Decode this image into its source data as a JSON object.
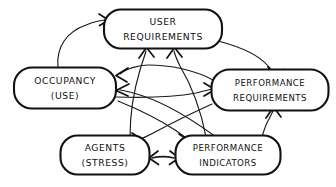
{
  "diagram": {
    "style": "hand-drawn sketch",
    "background_color": "#ffffff",
    "ink_color": "#111111",
    "nodes": [
      {
        "id": "user-requirements",
        "line1": "USER",
        "line2": "REQUIREMENTS",
        "x": 163,
        "y": 29,
        "width": 118,
        "height": 39
      },
      {
        "id": "occupancy-use",
        "line1": "OCCUPANCY",
        "line2": "(USE)",
        "x": 65,
        "y": 88,
        "width": 102,
        "height": 41
      },
      {
        "id": "performance-requirements",
        "line1": "PERFORMANCE",
        "line2": "REQUIREMENTS",
        "x": 270,
        "y": 90,
        "width": 117,
        "height": 41
      },
      {
        "id": "agents-stress",
        "line1": "AGENTS",
        "line2": "(STRESS)",
        "x": 105,
        "y": 155,
        "width": 89,
        "height": 39
      },
      {
        "id": "performance-indicators",
        "line1": "PERFORMANCE",
        "line2": "INDICATORS",
        "x": 228,
        "y": 155,
        "width": 105,
        "height": 39
      }
    ],
    "edges": [
      {
        "id": "occupancy-to-user-requirements",
        "from": "occupancy-use",
        "to": "user-requirements",
        "arrows": "single"
      },
      {
        "id": "user-requirements-to-performance-requirements",
        "from": "user-requirements",
        "to": "performance-requirements",
        "arrows": "single"
      },
      {
        "id": "performance-indicators-to-user-requirements",
        "from": "performance-indicators",
        "to": "user-requirements",
        "arrows": "single"
      },
      {
        "id": "agents-to-user-requirements",
        "from": "agents-stress",
        "to": "user-requirements",
        "arrows": "single"
      },
      {
        "id": "performance-requirements-to-occupancy",
        "from": "performance-requirements",
        "to": "occupancy-use",
        "arrows": "single"
      },
      {
        "id": "performance-indicators-to-occupancy",
        "from": "performance-indicators",
        "to": "occupancy-use",
        "arrows": "single"
      },
      {
        "id": "occupancy-to-performance-requirements",
        "from": "occupancy-use",
        "to": "performance-requirements",
        "arrows": "single"
      },
      {
        "id": "occupancy-to-performance-indicators",
        "from": "occupancy-use",
        "to": "performance-indicators",
        "arrows": "single"
      },
      {
        "id": "performance-requirements-to-agents",
        "from": "performance-requirements",
        "to": "agents-stress",
        "arrows": "single"
      },
      {
        "id": "performance-indicators-to-performance-requirements",
        "from": "performance-indicators",
        "to": "performance-requirements",
        "arrows": "single"
      },
      {
        "id": "agents-performance-indicators-bidirectional",
        "from": "agents-stress",
        "to": "performance-indicators",
        "arrows": "double"
      }
    ]
  }
}
